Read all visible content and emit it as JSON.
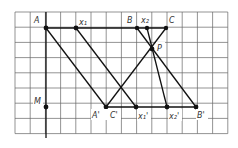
{
  "diagram": {
    "grid": {
      "x0": 15,
      "y0": 12,
      "cols": 14,
      "rows": 8,
      "step": 15.2,
      "color": "#555555"
    },
    "points": {
      "A": {
        "x": 46,
        "y": 28,
        "label": "A"
      },
      "X1": {
        "x": 76,
        "y": 28,
        "label": "x₁"
      },
      "B": {
        "x": 137,
        "y": 28,
        "label": "B"
      },
      "X2": {
        "x": 147,
        "y": 28,
        "label": "x₂"
      },
      "C": {
        "x": 166,
        "y": 28,
        "label": "C"
      },
      "P": {
        "x": 152,
        "y": 49,
        "label": "P"
      },
      "M": {
        "x": 46,
        "y": 107,
        "label": "M"
      },
      "A2": {
        "x": 106,
        "y": 107,
        "label": "A', C'"
      },
      "X1b": {
        "x": 136,
        "y": 107,
        "label": "x₁'"
      },
      "X2b": {
        "x": 167,
        "y": 107,
        "label": "x₂'"
      },
      "B2": {
        "x": 196,
        "y": 107,
        "label": "B'"
      }
    },
    "labels": {
      "A": "A",
      "X1": "x₁",
      "B": "B",
      "X2": "x₂",
      "C": "C",
      "P": "P",
      "M": "M",
      "A2": "A'",
      "C2": "C'",
      "X1b": "x₁'",
      "X2b": "x₂'",
      "B2": "B'"
    }
  }
}
